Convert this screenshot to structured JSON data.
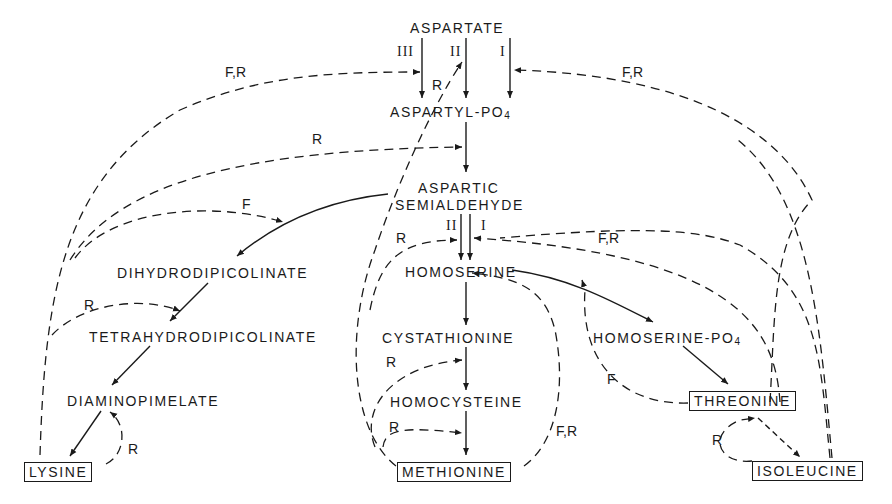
{
  "diagram": {
    "type": "metabolic-pathway",
    "nodes": {
      "aspartate": "ASPARTATE",
      "aspartyl_po4": "ASPARTYL-PO",
      "aspartyl_po4_sub": "4",
      "aspartic": "ASPARTIC",
      "semialdehyde": "SEMIALDEHYDE",
      "homoserine": "HOMOSERINE",
      "dihydrodipicolinate": "DIHYDRODIPICOLINATE",
      "tetrahydrodipicolinate": "TETRAHYDRODIPICOLINATE",
      "diaminopimelate": "DIAMINOPIMELATE",
      "lysine": "LYSINE",
      "cystathionine": "CYSTATHIONINE",
      "homocysteine": "HOMOCYSTEINE",
      "methionine": "METHIONINE",
      "homoserine_po4": "HOMOSERINE-PO",
      "homoserine_po4_sub": "4",
      "threonine": "THREONINE",
      "isoleucine": "ISOLEUCINE"
    },
    "isozyme_labels": {
      "ak_iii": "III",
      "ak_ii": "II",
      "ak_i": "I",
      "hd_ii": "II",
      "hd_i": "I"
    },
    "edge_labels": {
      "lysine_to_ak3": "F,R",
      "met_to_ak2": "R",
      "thr_to_ak1": "F,R",
      "lys_to_asa": "R",
      "lys_to_dhdp": "F",
      "met_to_hd2": "R",
      "thr_to_hd1": "F,R",
      "lys_to_thdp": "R",
      "lys_self": "R",
      "met_to_cysta": "R",
      "met_to_homocys": "R",
      "met_to_hser": "F,R",
      "thr_to_hser": "F",
      "ile_self": "R"
    },
    "legend": {
      "F": "feedback inhibition",
      "R": "repression"
    },
    "colors": {
      "ink": "#1a1a1a",
      "background": "#ffffff"
    }
  }
}
